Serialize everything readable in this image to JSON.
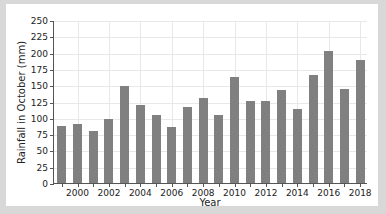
{
  "chart_data": {
    "type": "bar",
    "title": "",
    "xlabel": "Year",
    "ylabel": "Rainfall in October (mm)",
    "categories": [
      1999,
      2000,
      2001,
      2002,
      2003,
      2004,
      2005,
      2006,
      2007,
      2008,
      2009,
      2010,
      2011,
      2012,
      2013,
      2014,
      2015,
      2016,
      2017,
      2018
    ],
    "values": [
      87,
      90,
      80,
      98,
      149,
      119,
      105,
      86,
      117,
      130,
      104,
      162,
      126,
      126,
      142,
      114,
      166,
      202,
      144,
      189
    ],
    "ylim": [
      0,
      250
    ],
    "yticks": [
      0,
      25,
      50,
      75,
      100,
      125,
      150,
      175,
      200,
      225,
      250
    ],
    "xticks": [
      2000,
      2002,
      2004,
      2006,
      2008,
      2010,
      2012,
      2014,
      2016,
      2018
    ],
    "grid": true,
    "legend": false,
    "bar_color": "#808080",
    "axis_color": "#555555",
    "grid_color": "#e8e8e8",
    "plot_background": "#ffffff",
    "figure_background": "#d8d8d8"
  }
}
